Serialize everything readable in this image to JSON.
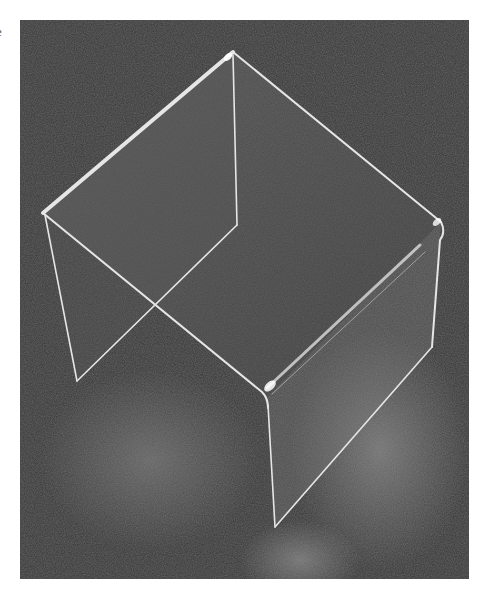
{
  "edge_text": "e",
  "photo": {
    "subject": "clear acrylic riser display stand",
    "background_color": "#363636",
    "edge_color": "#e8e8e8",
    "panel_tint": "#9a9a9a"
  }
}
